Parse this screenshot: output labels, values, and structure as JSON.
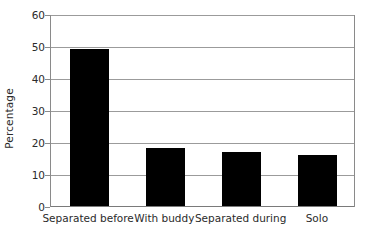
{
  "chart_data": {
    "type": "bar",
    "title": "",
    "subtitle": "",
    "xlabel": "",
    "ylabel": "Percentage",
    "categories": [
      "Separated before",
      "With buddy",
      "Separated during",
      "Solo"
    ],
    "values": [
      49,
      18,
      17,
      16
    ],
    "series": [
      {
        "name": "Percentage",
        "values": [
          49,
          18,
          17,
          16
        ]
      }
    ],
    "ylim": [
      0,
      60
    ],
    "yticks": [
      0,
      10,
      20,
      30,
      40,
      50,
      60
    ],
    "ytick_labels": [
      "0",
      "10",
      "20",
      "30",
      "40",
      "50",
      "60"
    ],
    "grid": "horizontal",
    "legend": "none",
    "bar_color": "#000000",
    "gridline_color": "#9b9b9b",
    "axis_color": "#8a8a8a",
    "text_color": "#2b2b2b",
    "background_color": "#ffffff",
    "annotations": []
  }
}
